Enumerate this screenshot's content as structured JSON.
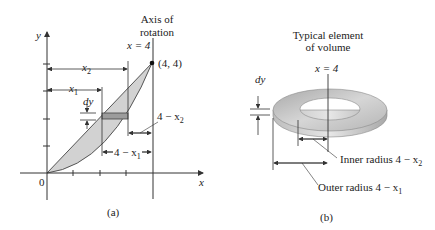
{
  "panel_a": {
    "caption": "(a)",
    "axis_title_line1": "Axis of",
    "axis_title_line2": "rotation",
    "axis_eq": "x = 4",
    "point_label": "(4, 4)",
    "y_axis": "y",
    "x_axis": "x",
    "origin": "0",
    "x2_label": "x",
    "x2_sub": "2",
    "x1_label": "x",
    "x1_sub": "1",
    "dy": "dy",
    "four_minus_x2": "4 − x",
    "four_minus_x2_sub": "2",
    "four_minus_x1": "4 − x",
    "four_minus_x1_sub": "1"
  },
  "panel_b": {
    "caption": "(b)",
    "title_line1": "Typical element",
    "title_line2": "of volume",
    "axis_eq": "x = 4",
    "dy": "dy",
    "inner_radius": "Inner radius 4 − x",
    "inner_sub": "2",
    "outer_radius": "Outer radius 4 − x",
    "outer_sub": "1"
  },
  "colors": {
    "region_fill": "#cfcfcf",
    "strip_fill": "#9a9a9a",
    "washer_top": "#c4c4c4",
    "line": "#333333"
  }
}
